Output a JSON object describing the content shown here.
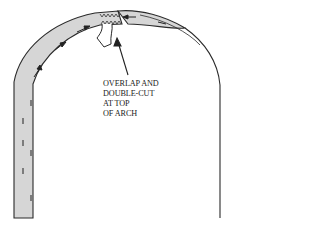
{
  "diagram": {
    "annotation": {
      "lines": [
        "OVERLAP AND",
        "DOUBLE-CUT",
        "AT TOP",
        "OF ARCH"
      ]
    },
    "elements": [
      {
        "name": "paper-strip",
        "description": "Shaded strip running up the left jamb and over the arch"
      },
      {
        "name": "direction-arrows",
        "description": "Small arrows along strip pointing toward the top of the arch"
      },
      {
        "name": "overlap-zone",
        "description": "Zigzag double-cut overlap at the top of the arch"
      },
      {
        "name": "curled-flap",
        "description": "Folded paper flap hanging down from overlap"
      },
      {
        "name": "pointer-arrow",
        "description": "Leader arrow from label to overlap"
      },
      {
        "name": "arch-outline-right",
        "description": "Right side of the arch opening outline"
      }
    ],
    "colors": {
      "strip_fill": "#d6d6d6",
      "stroke": "#2a2a2a",
      "background": "#ffffff"
    }
  }
}
